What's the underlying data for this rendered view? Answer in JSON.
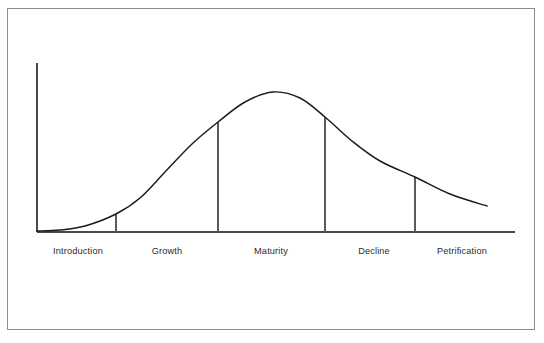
{
  "figure": {
    "frame": {
      "border_color": "#8d8d8d"
    },
    "background_color": "#ffffff"
  },
  "chart_data": {
    "type": "line",
    "title": "",
    "subtitle": "",
    "xlabel": "",
    "ylabel": "",
    "grid": false,
    "legend": null,
    "axes": {
      "y_axis_visible": true,
      "x_axis_visible": true,
      "y_axis_x_px": 37,
      "y_axis_top_px": 63,
      "baseline_y_px": 232,
      "x_axis_start_px": 37,
      "x_axis_end_px": 515,
      "axis_color": "#4a4a4a"
    },
    "curve": {
      "name": "Life cycle curve",
      "color": "#1a1a1a",
      "shape": "bell",
      "start": {
        "x": 37,
        "y": 231
      },
      "peak": {
        "x": 273,
        "y": 92
      },
      "end": {
        "x": 487,
        "y": 206
      },
      "points": [
        {
          "x": 37,
          "y": 231
        },
        {
          "x": 60,
          "y": 230
        },
        {
          "x": 85,
          "y": 226
        },
        {
          "x": 116,
          "y": 214
        },
        {
          "x": 140,
          "y": 198
        },
        {
          "x": 165,
          "y": 172
        },
        {
          "x": 192,
          "y": 144
        },
        {
          "x": 218,
          "y": 122
        },
        {
          "x": 245,
          "y": 102
        },
        {
          "x": 273,
          "y": 92
        },
        {
          "x": 300,
          "y": 98
        },
        {
          "x": 325,
          "y": 117
        },
        {
          "x": 352,
          "y": 141
        },
        {
          "x": 380,
          "y": 161
        },
        {
          "x": 415,
          "y": 177
        },
        {
          "x": 450,
          "y": 194
        },
        {
          "x": 487,
          "y": 206
        }
      ]
    },
    "dividers": [
      {
        "label": "introduction-growth-divider",
        "x": 116,
        "top_y": 214,
        "bottom_y": 232
      },
      {
        "label": "growth-maturity-divider",
        "x": 218,
        "top_y": 122,
        "bottom_y": 232
      },
      {
        "label": "maturity-decline-divider",
        "x": 325,
        "top_y": 117,
        "bottom_y": 232
      },
      {
        "label": "decline-petrification-divider",
        "x": 415,
        "top_y": 177,
        "bottom_y": 232
      }
    ],
    "categories": [
      "Introduction",
      "Growth",
      "Maturity",
      "Decline",
      "Petrification"
    ],
    "category_positions_px": [
      78,
      167,
      271,
      374,
      462
    ],
    "category_label_y_px": 251
  },
  "labels": {
    "stages": [
      {
        "id": "introduction",
        "text": "Introduction",
        "x": 78,
        "y": 251
      },
      {
        "id": "growth",
        "text": "Growth",
        "x": 167,
        "y": 251
      },
      {
        "id": "maturity",
        "text": "Maturity",
        "x": 271,
        "y": 251
      },
      {
        "id": "decline",
        "text": "Decline",
        "x": 374,
        "y": 251
      },
      {
        "id": "petrification",
        "text": "Petrification",
        "x": 462,
        "y": 251
      }
    ]
  },
  "colors": {
    "curve": "#1a1a1a",
    "axis": "#4a4a4a",
    "divider": "#5a5a5a",
    "frame": "#8d8d8d",
    "text": "#2b2b2b",
    "background": "#ffffff"
  }
}
